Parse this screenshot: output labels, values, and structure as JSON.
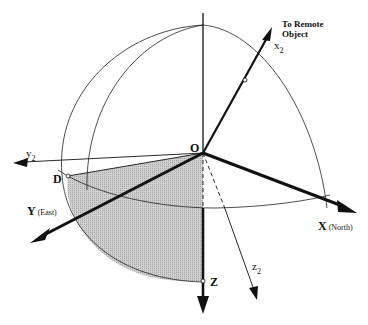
{
  "diagram": {
    "type": "3d-coordinate-frame-sphere",
    "origin_label": "O",
    "labels": {
      "remote_line1": "To Remote",
      "remote_line2": "Object",
      "x2": "x",
      "x2_sub": "2",
      "y2": "y",
      "y2_sub": "2",
      "z2": "z",
      "z2_sub": "2",
      "X": "X",
      "X_note": "(North)",
      "Y": "Y",
      "Y_note": "(East)",
      "Z": "Z",
      "D": "D"
    },
    "axes": [
      {
        "name": "X",
        "direction": "North",
        "style": "bold"
      },
      {
        "name": "Y",
        "direction": "East",
        "style": "bold"
      },
      {
        "name": "Z",
        "direction": "Down",
        "style": "bold"
      },
      {
        "name": "x2",
        "direction": "To Remote Object",
        "style": "bold"
      },
      {
        "name": "y2",
        "style": "thin"
      },
      {
        "name": "z2",
        "style": "thin, dashed inside sphere"
      }
    ],
    "shaded_region": "sector bounded by O, D, Y-axis arc and Z axis",
    "colors": {
      "line": "#111111",
      "shade": "#c8c8c8",
      "background": "#ffffff"
    }
  }
}
